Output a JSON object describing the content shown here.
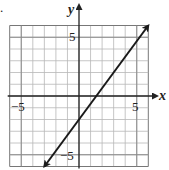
{
  "chart_data": {
    "type": "line",
    "title": "",
    "xlabel": "x",
    "ylabel": "y",
    "xlim": [
      -6,
      6
    ],
    "ylim": [
      -6,
      6
    ],
    "grid": true,
    "grid_step": 1,
    "x_tick_labels": [
      {
        "value": -5,
        "label": "−5"
      },
      {
        "value": 5,
        "label": "5"
      }
    ],
    "y_tick_labels": [
      {
        "value": 5,
        "label": "5"
      },
      {
        "value": -5,
        "label": "−5"
      }
    ],
    "series": [
      {
        "name": "line",
        "equation": "y = (4/3)x − 2",
        "x": [
          -3,
          6
        ],
        "y": [
          -6,
          6
        ],
        "arrows_both_ends": true
      }
    ],
    "legend": null
  },
  "labels": {
    "x_axis": "x",
    "y_axis": "y",
    "x_neg5": "−5",
    "x_pos5": "5",
    "y_pos5": "5",
    "y_neg5": "−5",
    "bullet": "."
  },
  "colors": {
    "grid": "#b8b8b8",
    "grid_border": "#777777",
    "axis": "#222222",
    "line": "#1a1a1a"
  }
}
